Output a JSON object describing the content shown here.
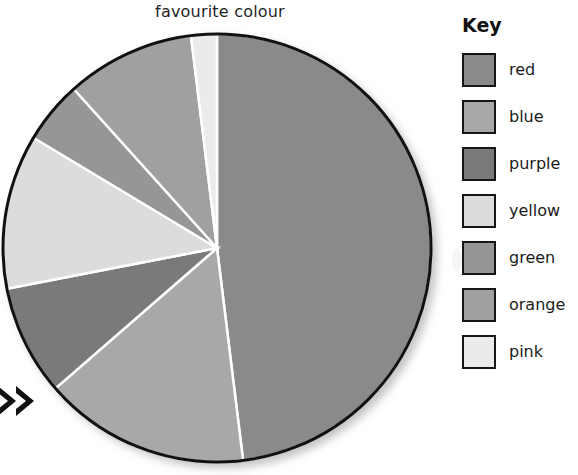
{
  "chart_data": {
    "type": "pie",
    "title": "favourite colour",
    "legend_title": "Key",
    "legend_position": "right",
    "start_angle_deg": 0,
    "direction": "clockwise",
    "categories": [
      "red",
      "blue",
      "purple",
      "yellow",
      "green",
      "orange",
      "pink"
    ],
    "values": [
      48.0,
      15.5,
      8.3,
      11.7,
      4.7,
      9.7,
      1.9
    ],
    "value_unit": "percent",
    "angles_deg": [
      173,
      56,
      30,
      42,
      17,
      35,
      7
    ],
    "slice_colors": [
      "#8a8a8a",
      "#a8a8a8",
      "#7a7a7a",
      "#dcdcdc",
      "#969696",
      "#a0a0a0",
      "#ebebeb"
    ],
    "outline_color": "#111111",
    "separator_color": "#ffffff",
    "xlabel": "",
    "ylabel": "",
    "grid": false
  },
  "legend": {
    "title": "Key",
    "items": [
      {
        "label": "red",
        "color": "#8a8a8a"
      },
      {
        "label": "blue",
        "color": "#a8a8a8"
      },
      {
        "label": "purple",
        "color": "#7a7a7a"
      },
      {
        "label": "yellow",
        "color": "#dcdcdc"
      },
      {
        "label": "green",
        "color": "#969696"
      },
      {
        "label": "orange",
        "color": "#a0a0a0"
      },
      {
        "label": "pink",
        "color": "#ebebeb"
      }
    ]
  },
  "annotations": {
    "arrow_marker": "double-chevron-right"
  }
}
